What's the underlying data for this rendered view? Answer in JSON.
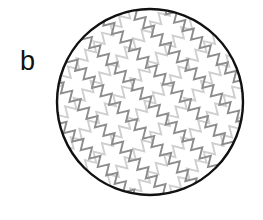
{
  "panel": {
    "label": "b",
    "label_position": {
      "x": 20,
      "y": 46
    }
  },
  "canvas": {
    "width": 263,
    "height": 220,
    "background_color": "#ffffff"
  },
  "figure": {
    "name": "circle-with-crossing-zigzag-lattice",
    "outline": {
      "shape": "circle",
      "center_x": 150,
      "center_y": 102,
      "radius": 93,
      "stroke_color": "#111111",
      "stroke_width": 2.4,
      "fill_color": "#ffffff"
    },
    "zigzag": {
      "period": 12,
      "amplitude": 5,
      "line_spacing": 26,
      "stroke_width": 1.9,
      "families": [
        {
          "name": "zigzag-family-dark",
          "angle_degrees": 45,
          "stroke_color": "#8c8c8c",
          "line_count": 9
        },
        {
          "name": "zigzag-family-light",
          "angle_degrees": -45,
          "stroke_color": "#cfcfcf",
          "line_count": 9
        }
      ]
    }
  }
}
